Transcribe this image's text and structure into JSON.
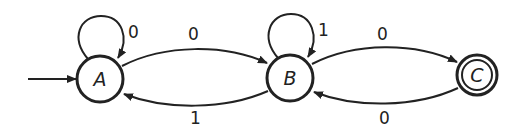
{
  "diagram": {
    "type": "finite-automaton",
    "start_state": "A",
    "states": [
      {
        "id": "A",
        "label": "A",
        "accepting": false,
        "cx": 100,
        "cy": 79
      },
      {
        "id": "B",
        "label": "B",
        "accepting": false,
        "cx": 290,
        "cy": 78
      },
      {
        "id": "C",
        "label": "C",
        "accepting": true,
        "cx": 477,
        "cy": 75
      }
    ],
    "transitions": [
      {
        "from": "A",
        "to": "A",
        "label": "0"
      },
      {
        "from": "A",
        "to": "B",
        "label": "0"
      },
      {
        "from": "B",
        "to": "A",
        "label": "1"
      },
      {
        "from": "B",
        "to": "B",
        "label": "1"
      },
      {
        "from": "B",
        "to": "C",
        "label": "0"
      },
      {
        "from": "C",
        "to": "B",
        "label": "0"
      }
    ]
  },
  "colors": {
    "stroke": "#222222",
    "background": "#ffffff"
  }
}
